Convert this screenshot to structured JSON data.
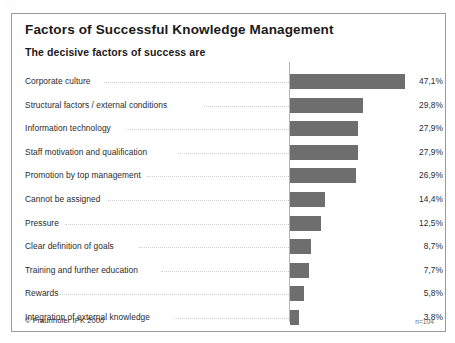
{
  "scan_mark": "···",
  "chart": {
    "title": "Factors of Successful Knowledge Management",
    "subtitle": "The decisive factors of success are",
    "copyright": "© Fraunhofer IPK 2000",
    "sample_note": "n=104",
    "accent_color": "#6e6e6e",
    "border_color": "#9a9a9a",
    "text_color": "#2b2b2b"
  },
  "chart_data": {
    "type": "bar",
    "orientation": "horizontal",
    "title": "Factors of Successful Knowledge Management",
    "subtitle": "The decisive factors of success are",
    "xlabel": "",
    "ylabel": "",
    "xlim": [
      0,
      50
    ],
    "grid": false,
    "legend": "none",
    "value_suffix": "%",
    "decimal_separator": ",",
    "annotation": "n=104",
    "source": "© Fraunhofer IPK 2000",
    "categories": [
      "Corporate culture",
      "Structural factors / external conditions",
      "Information technology",
      "Staff motivation and qualification",
      "Promotion by top management",
      "Cannot be assigned",
      "Pressure",
      "Clear definition of goals",
      "Training and further education",
      "Rewards",
      "Integration of external knowledge"
    ],
    "values": [
      47.1,
      29.8,
      27.9,
      27.9,
      26.9,
      14.4,
      12.5,
      8.7,
      7.7,
      5.8,
      3.8
    ],
    "value_labels": [
      "47,1%",
      "29,8%",
      "27,9%",
      "27,9%",
      "26,9%",
      "14,4%",
      "12,5%",
      "8,7%",
      "7,7%",
      "5,8%",
      "3,8%"
    ]
  }
}
